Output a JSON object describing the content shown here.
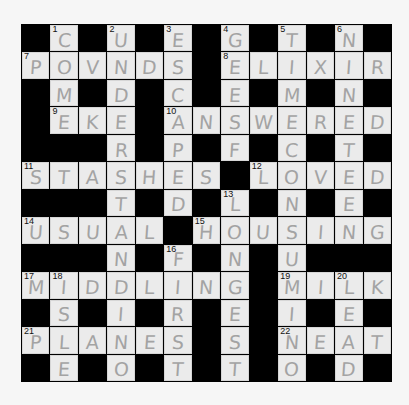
{
  "puzzle": {
    "rows": 13,
    "cols": 13,
    "colors": {
      "block": "#000000",
      "cell": "#ebebeb",
      "pencil": "#a3a3a3",
      "number": "#111111",
      "page": "#f6f6f6"
    },
    "grid": [
      [
        "#",
        "C",
        "#",
        "U",
        "#",
        "E",
        "#",
        "G",
        "#",
        "T",
        "#",
        "N",
        "#"
      ],
      [
        "P",
        "O",
        "V",
        "N",
        "D",
        "S",
        "#",
        "E",
        "L",
        "I",
        "X",
        "I",
        "R"
      ],
      [
        "#",
        "M",
        "#",
        "D",
        "#",
        "C",
        "#",
        "E",
        "#",
        "M",
        "#",
        "N",
        "#"
      ],
      [
        "#",
        "E",
        "K",
        "E",
        "#",
        "A",
        "N",
        "S",
        "W",
        "E",
        "R",
        "E",
        "D"
      ],
      [
        "#",
        "#",
        "#",
        "R",
        "#",
        "P",
        "#",
        "F",
        "#",
        "C",
        "#",
        "T",
        "#"
      ],
      [
        "S",
        "T",
        "A",
        "S",
        "H",
        "E",
        "S",
        "#",
        "L",
        "O",
        "V",
        "E",
        "D"
      ],
      [
        "#",
        "#",
        "#",
        "T",
        "#",
        "D",
        "#",
        "L",
        "#",
        "N",
        "#",
        "E",
        "#"
      ],
      [
        "U",
        "S",
        "U",
        "A",
        "L",
        "#",
        "H",
        "O",
        "U",
        "S",
        "I",
        "N",
        "G"
      ],
      [
        "#",
        "#",
        "#",
        "N",
        "#",
        "F",
        "#",
        "N",
        "#",
        "U",
        "#",
        "#",
        "#"
      ],
      [
        "M",
        "I",
        "D",
        "D",
        "L",
        "I",
        "N",
        "G",
        "#",
        "M",
        "I",
        "L",
        "K"
      ],
      [
        "#",
        "S",
        "#",
        "I",
        "#",
        "R",
        "#",
        "E",
        "#",
        "I",
        "#",
        "E",
        "#"
      ],
      [
        "P",
        "L",
        "A",
        "N",
        "E",
        "S",
        "#",
        "S",
        "#",
        "N",
        "E",
        "A",
        "T"
      ],
      [
        "#",
        "E",
        "#",
        "O",
        "#",
        "T",
        "#",
        "T",
        "#",
        "O",
        "#",
        "D",
        "#"
      ]
    ],
    "numbers": [
      {
        "row": 0,
        "col": 1,
        "n": "1"
      },
      {
        "row": 0,
        "col": 3,
        "n": "2"
      },
      {
        "row": 0,
        "col": 5,
        "n": "3"
      },
      {
        "row": 0,
        "col": 7,
        "n": "4"
      },
      {
        "row": 0,
        "col": 9,
        "n": "5"
      },
      {
        "row": 0,
        "col": 11,
        "n": "6"
      },
      {
        "row": 1,
        "col": 0,
        "n": "7"
      },
      {
        "row": 1,
        "col": 7,
        "n": "8"
      },
      {
        "row": 3,
        "col": 1,
        "n": "9"
      },
      {
        "row": 3,
        "col": 5,
        "n": "10"
      },
      {
        "row": 5,
        "col": 0,
        "n": "11"
      },
      {
        "row": 5,
        "col": 8,
        "n": "12"
      },
      {
        "row": 6,
        "col": 7,
        "n": "13"
      },
      {
        "row": 7,
        "col": 0,
        "n": "14"
      },
      {
        "row": 7,
        "col": 6,
        "n": "15"
      },
      {
        "row": 8,
        "col": 5,
        "n": "16"
      },
      {
        "row": 9,
        "col": 0,
        "n": "17"
      },
      {
        "row": 9,
        "col": 1,
        "n": "18"
      },
      {
        "row": 9,
        "col": 9,
        "n": "19"
      },
      {
        "row": 9,
        "col": 11,
        "n": "20"
      },
      {
        "row": 11,
        "col": 0,
        "n": "21"
      },
      {
        "row": 11,
        "col": 9,
        "n": "22"
      }
    ],
    "across": [
      {
        "n": "7",
        "answer": "POUNDS"
      },
      {
        "n": "8",
        "answer": "ELIXIR"
      },
      {
        "n": "9",
        "answer": "EKE"
      },
      {
        "n": "10",
        "answer": "ANSWERED"
      },
      {
        "n": "11",
        "answer": "STASHES"
      },
      {
        "n": "12",
        "answer": "LOVED"
      },
      {
        "n": "14",
        "answer": "USUAL"
      },
      {
        "n": "15",
        "answer": "HOUSING"
      },
      {
        "n": "17",
        "answer": "MIDDLING"
      },
      {
        "n": "19",
        "answer": "MILK"
      },
      {
        "n": "21",
        "answer": "PLANES"
      },
      {
        "n": "22",
        "answer": "NEAT"
      }
    ],
    "down": [
      {
        "n": "1",
        "answer": "COMET"
      },
      {
        "n": "2",
        "answer": "UNDERSTAND"
      },
      {
        "n": "3",
        "answer": "ESCAPED"
      },
      {
        "n": "4",
        "answer": "GEESE"
      },
      {
        "n": "5",
        "answer": "TIMECONSUMING"
      },
      {
        "n": "6",
        "answer": "NINETEEN"
      },
      {
        "n": "13",
        "answer": "LONGEST"
      },
      {
        "n": "16",
        "answer": "FIRST"
      },
      {
        "n": "18",
        "answer": "ISLE"
      },
      {
        "n": "20",
        "answer": "LEAD"
      }
    ]
  }
}
